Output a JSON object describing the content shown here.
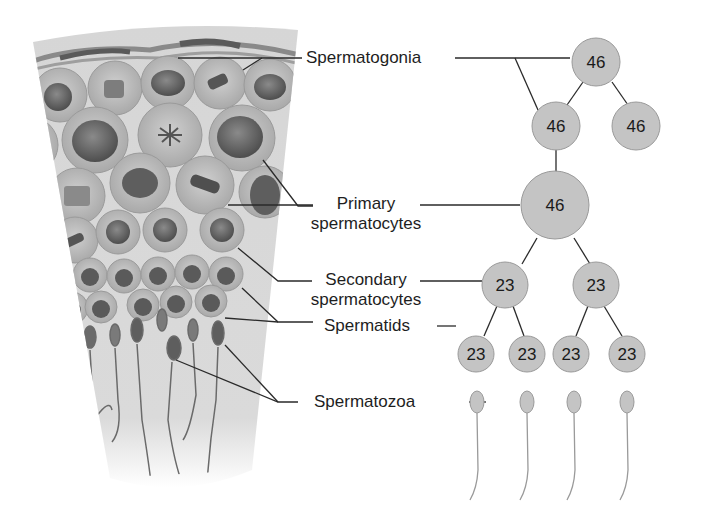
{
  "labels": {
    "spermatogonia": "Spermatogonia",
    "primary_1": "Primary",
    "primary_2": "spermatocytes",
    "secondary_1": "Secondary",
    "secondary_2": "spermatocytes",
    "spermatids": "Spermatids",
    "spermatozoa": "Spermatozoa"
  },
  "tree": {
    "spermatogonia_top": "46",
    "spermatogonia_left": "46",
    "spermatogonia_right": "46",
    "primary": "46",
    "secondary": [
      "23",
      "23"
    ],
    "spermatids": [
      "23",
      "23",
      "23",
      "23"
    ],
    "spermatozoa_count": 4
  },
  "colors": {
    "node_fill": "#c4c4c4",
    "node_stroke": "#9a9a9a",
    "line": "#2a2a2a",
    "tissue_bg": "#d8d8d8",
    "cell_fill": "#b8b8b8",
    "nucleus": "#6e6e6e"
  }
}
